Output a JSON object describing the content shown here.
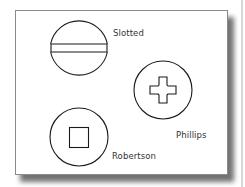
{
  "diagram": {
    "stroke_color": "#1a1a1a",
    "label_color": "#333333",
    "frame_border_color": "#8a8a8a",
    "shadow_color": "#5a5a5a",
    "heads": [
      {
        "id": "slotted",
        "label": "Slotted",
        "shape": "circle-with-horizontal-slot",
        "center": [
          79,
          50
        ],
        "radius": 29
      },
      {
        "id": "phillips",
        "label": "Phillips",
        "shape": "circle-with-cross",
        "center": [
          163,
          90
        ],
        "radius": 29
      },
      {
        "id": "robertson",
        "label": "Robertson",
        "shape": "circle-with-square",
        "center": [
          79,
          137
        ],
        "radius": 29
      }
    ]
  }
}
